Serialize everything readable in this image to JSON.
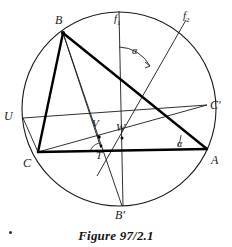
{
  "figure": {
    "caption": "Figure 97/2.1",
    "stroke_color": "#1a1a1a",
    "thick_stroke_color": "#000000",
    "background": "#ffffff",
    "canvas": {
      "width": 232,
      "height": 247
    },
    "circle": {
      "cx": 119,
      "cy": 109,
      "r": 97
    },
    "points": {
      "A": {
        "x": 207,
        "y": 149,
        "label": "A",
        "label_x": 211,
        "label_y": 154
      },
      "B": {
        "x": 63,
        "y": 33,
        "label": "B",
        "label_x": 55,
        "label_y": 14
      },
      "C": {
        "x": 38,
        "y": 152,
        "label": "C",
        "label_x": 23,
        "label_y": 158
      },
      "Bp": {
        "x": 122,
        "y": 206,
        "label": "B'",
        "label_x": 116,
        "label_y": 209
      },
      "Cp": {
        "x": 207,
        "y": 105,
        "label": "C'",
        "label_x": 211,
        "label_y": 100
      },
      "U": {
        "x": 23,
        "y": 118,
        "label": "U",
        "label_x": 5,
        "label_y": 111
      },
      "V": {
        "x": 99,
        "y": 137,
        "label": "V",
        "label_x": 93,
        "label_y": 119
      },
      "W": {
        "x": 122,
        "y": 138,
        "label": "W",
        "label_x": 117,
        "label_y": 123
      },
      "T": {
        "x": 101,
        "y": 146,
        "label": "T",
        "label_x": 95,
        "label_y": 150
      }
    },
    "axes": [
      {
        "name": "f1",
        "label": "f",
        "subscript": "1",
        "label_x": 115,
        "label_y": 14,
        "x1": 119,
        "y1": 12,
        "x2": 123,
        "y2": 206
      },
      {
        "name": "f2",
        "label": "f",
        "subscript": "2",
        "label_x": 184,
        "label_y": 11,
        "x1": 186,
        "y1": 20,
        "x2": 97,
        "y2": 176
      }
    ],
    "angles": [
      {
        "name": "alpha-at-center",
        "label": "α",
        "label_x": 133,
        "label_y": 48
      },
      {
        "name": "alpha-at-vertex-a",
        "label": "α",
        "label_x": 178,
        "label_y": 140
      }
    ],
    "segments": [
      {
        "name": "side-bc",
        "from": "B",
        "to": "C",
        "weight": "thick"
      },
      {
        "name": "side-ba",
        "from": "B",
        "to": "A",
        "weight": "thick"
      },
      {
        "name": "side-ca",
        "from": "C",
        "to": "A",
        "weight": "thick"
      },
      {
        "name": "cevian-b-to-bprime",
        "from": "B",
        "to": "Bp",
        "weight": "thin"
      },
      {
        "name": "cevian-c-to-cprime",
        "from": "C",
        "to": "Cp",
        "weight": "thin"
      },
      {
        "name": "chord-u-to-cprime",
        "from": "U",
        "to": "Cp",
        "weight": "thin"
      },
      {
        "name": "chord-c-to-u",
        "from": "C",
        "to": "U",
        "weight": "thin"
      },
      {
        "name": "segment-b-to-t",
        "from": "B",
        "to": "T",
        "weight": "thin"
      }
    ]
  }
}
